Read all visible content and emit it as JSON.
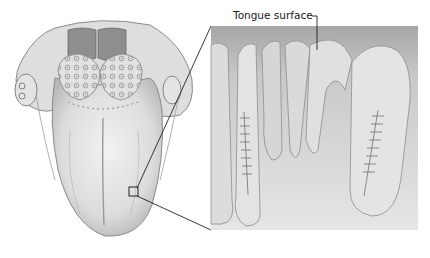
{
  "figure": {
    "main_view": "Dorsal view of tongue",
    "inset_view": "Magnified cross-section of papillae",
    "callout_label": "Tongue surface"
  },
  "colors": {
    "background": "#ffffff",
    "tissue_light": "#eeeeee",
    "tissue_mid": "#cfcfcf",
    "tissue_dark": "#9a9a9a",
    "inset_top": "#a9a9a9",
    "line": "#222222"
  }
}
